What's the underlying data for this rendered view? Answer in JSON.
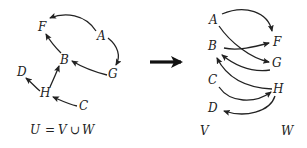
{
  "left_graph": {
    "caption": {
      "U": "U",
      "eq": "=",
      "V": "V",
      "cup": "∪",
      "W": "W"
    },
    "nodes": [
      {
        "id": "F",
        "label": "F"
      },
      {
        "id": "A",
        "label": "A"
      },
      {
        "id": "B",
        "label": "B"
      },
      {
        "id": "G",
        "label": "G"
      },
      {
        "id": "D",
        "label": "D"
      },
      {
        "id": "H",
        "label": "H"
      },
      {
        "id": "C",
        "label": "C"
      }
    ],
    "edges": [
      {
        "from": "A",
        "to": "F"
      },
      {
        "from": "A",
        "to": "G"
      },
      {
        "from": "B",
        "to": "F"
      },
      {
        "from": "G",
        "to": "B"
      },
      {
        "from": "H",
        "to": "B"
      },
      {
        "from": "H",
        "to": "D"
      },
      {
        "from": "C",
        "to": "H"
      }
    ]
  },
  "transform_arrow": "right-arrow",
  "right_graph": {
    "V_label": "V",
    "W_label": "W",
    "V_nodes": [
      "A",
      "B",
      "C",
      "D"
    ],
    "W_nodes": [
      "F",
      "G",
      "H"
    ],
    "nodes": [
      {
        "id": "A",
        "label": "A"
      },
      {
        "id": "B",
        "label": "B"
      },
      {
        "id": "C",
        "label": "C"
      },
      {
        "id": "D",
        "label": "D"
      },
      {
        "id": "F",
        "label": "F"
      },
      {
        "id": "G",
        "label": "G"
      },
      {
        "id": "H",
        "label": "H"
      }
    ],
    "edges": [
      {
        "from": "A",
        "to": "F"
      },
      {
        "from": "A",
        "to": "G"
      },
      {
        "from": "B",
        "to": "F"
      },
      {
        "from": "G",
        "to": "B"
      },
      {
        "from": "H",
        "to": "B"
      },
      {
        "from": "C",
        "to": "H"
      },
      {
        "from": "H",
        "to": "D"
      }
    ]
  }
}
